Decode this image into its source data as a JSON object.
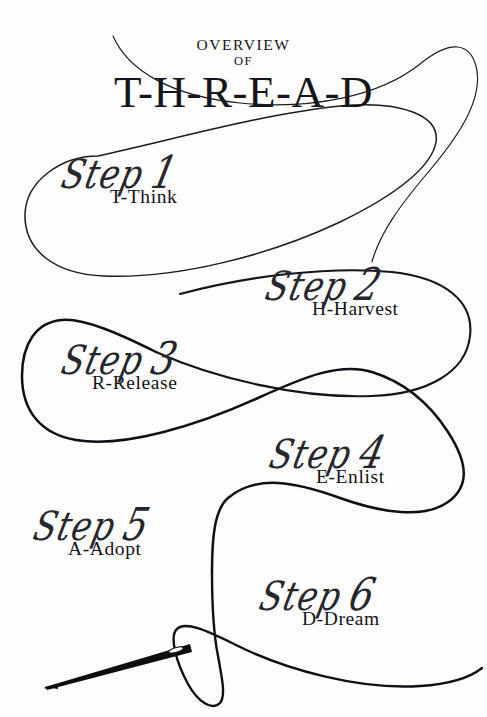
{
  "page": {
    "watermark": "",
    "background_color": "#fdfdfd",
    "ink_color": "#15161a"
  },
  "header": {
    "overview_label": "OVERVIEW",
    "of_label": "OF",
    "acronym": "T-H-R-E-A-D"
  },
  "steps": [
    {
      "script": "Step",
      "number": "1",
      "key": "T-Think",
      "letter": "T",
      "word": "Think"
    },
    {
      "script": "Step",
      "number": "2",
      "key": "H-Harvest",
      "letter": "H",
      "word": "Harvest"
    },
    {
      "script": "Step",
      "number": "3",
      "key": "R-Release",
      "letter": "R",
      "word": "Release"
    },
    {
      "script": "Step",
      "number": "4",
      "key": "E-Enlist",
      "letter": "E",
      "word": "Enlist"
    },
    {
      "script": "Step",
      "number": "5",
      "key": "A-Adopt",
      "letter": "A",
      "word": "Adopt"
    },
    {
      "script": "Step",
      "number": "6",
      "key": "D-Dream",
      "letter": "D",
      "word": "Dream"
    }
  ],
  "artwork": {
    "thread_label": "sewing-thread-curve",
    "needle_label": "sewing-needle",
    "thread_color": "#111114",
    "needle_color": "#0d0d10"
  }
}
